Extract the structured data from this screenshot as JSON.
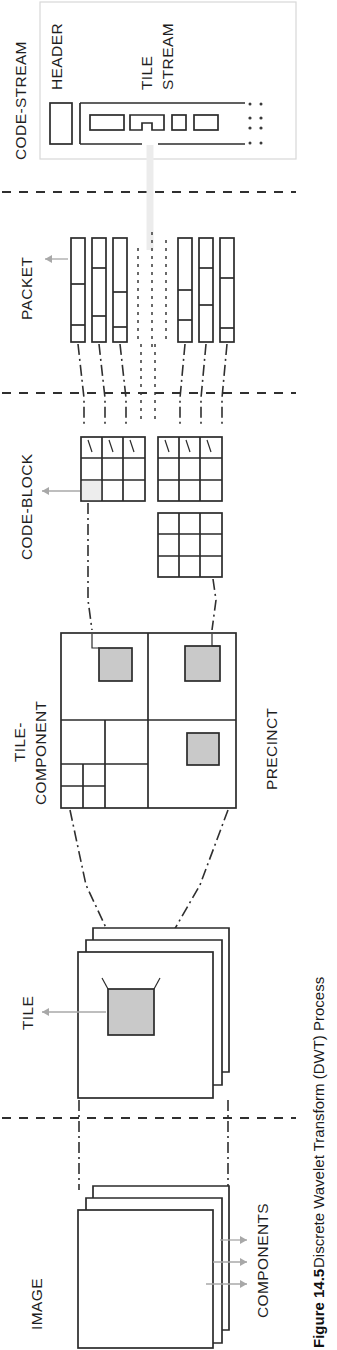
{
  "figure": {
    "caption_number": "Figure 14.5",
    "caption_text": "Discrete Wavelet Transform (DWT) Process",
    "orientation": "rotated-90-ccw",
    "page_width": 337,
    "page_height": 1350
  },
  "labels": {
    "code_stream": "CODE-STREAM",
    "header": "HEADER",
    "tile_stream_line1": "TILE",
    "tile_stream_line2": "STREAM",
    "packet": "PACKET",
    "code_block": "CODE-BLOCK",
    "tile_component_line1": "TILE-",
    "tile_component_line2": "COMPONENT",
    "precinct": "PRECINCT",
    "tile": "TILE",
    "image": "IMAGE",
    "components": "COMPONENTS"
  },
  "sections": [
    {
      "id": "code-stream",
      "label": "CODE-STREAM"
    },
    {
      "id": "packet",
      "label": "PACKET"
    },
    {
      "id": "code-block",
      "label": "CODE-BLOCK"
    },
    {
      "id": "tile-component",
      "label": "TILE-COMPONENT"
    },
    {
      "id": "tile",
      "label": "TILE"
    },
    {
      "id": "image",
      "label": "IMAGE"
    }
  ],
  "colors": {
    "line": "#2b2b2b",
    "highlight_fill": "#c9c9c9",
    "background": "#ffffff",
    "arrow": "#a8a8a8",
    "divider": "#2f2f2f"
  },
  "structures": {
    "code_stream": {
      "header_boxes": 1,
      "tile_stream_segments": 4,
      "continuation_marker": "dotted"
    },
    "packet": {
      "bar_count": 7,
      "bar_segments_each": [
        3,
        4,
        4,
        3,
        3,
        3,
        3
      ],
      "ellipsis_columns": 3
    },
    "code_block": {
      "grids": 3,
      "grid_rows": 3,
      "grid_cols": 3,
      "highlighted_cell": "bottom-left-of-first-grid"
    },
    "tile_component": {
      "decomposition_levels": 3,
      "precinct_highlights": 3
    },
    "tile": {
      "stack_count": 3,
      "highlighted_tile": 1
    },
    "image": {
      "stack_count": 3,
      "component_arrows": 3
    }
  }
}
